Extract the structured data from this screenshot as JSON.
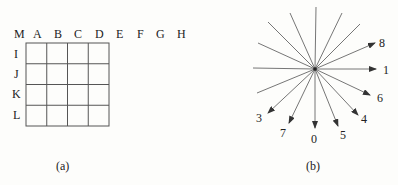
{
  "figure_a": {
    "caption": "(a)",
    "column_labels": [
      "M",
      "A",
      "B",
      "C",
      "D",
      "E",
      "F",
      "G",
      "H"
    ],
    "row_labels": [
      "I",
      "J",
      "K",
      "L"
    ],
    "grid": {
      "rows": 4,
      "cols": 4
    }
  },
  "figure_b": {
    "caption": "(b)",
    "direction_labels": [
      "8",
      "1",
      "6",
      "4",
      "5",
      "0",
      "7",
      "3"
    ],
    "line_count": 16
  },
  "colors": {
    "line": "#555555",
    "text": "#222222",
    "background": "#fdfdfb"
  }
}
